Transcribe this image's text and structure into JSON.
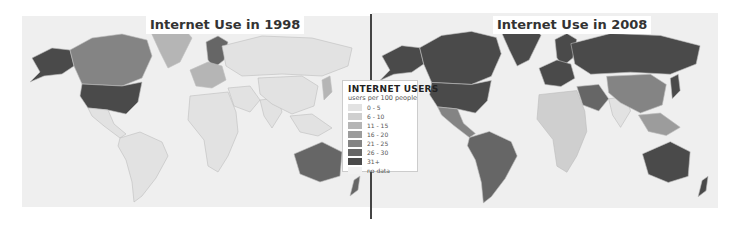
{
  "maps": [
    {
      "title": "Internet Use in 1998",
      "regions": {
        "usa": "31+",
        "alaska": "31+",
        "canada": "21 - 25",
        "greenland": "11 - 15",
        "mexico_central_america": "0 - 5",
        "south_america": "0 - 5",
        "scandinavia": "26 - 30",
        "western_europe": "11 - 15",
        "russia_asia": "0 - 5",
        "africa": "0 - 5",
        "middle_east": "0 - 5",
        "india": "0 - 5",
        "china": "0 - 5",
        "japan": "11 - 15",
        "southeast_asia": "0 - 5",
        "australia": "26 - 30",
        "new_zealand": "26 - 30"
      }
    },
    {
      "title": "Internet Use in 2008",
      "regions": {
        "usa": "31+",
        "alaska": "31+",
        "canada": "31+",
        "greenland": "31+",
        "mexico_central_america": "21 - 25",
        "south_america": "26 - 30",
        "scandinavia": "31+",
        "western_europe": "31+",
        "russia_asia": "31+",
        "africa": "6 - 10",
        "middle_east": "26 - 30",
        "india": "0 - 5",
        "china": "21 - 25",
        "japan": "31+",
        "southeast_asia": "16 - 20",
        "australia": "31+",
        "new_zealand": "31+"
      }
    }
  ],
  "legend": {
    "title": "INTERNET USERS",
    "subtitle": "users per 100 people",
    "items": [
      {
        "label": "0 - 5",
        "color": "#e2e2e2"
      },
      {
        "label": "6 - 10",
        "color": "#cfcfcf"
      },
      {
        "label": "11 - 15",
        "color": "#b5b5b5"
      },
      {
        "label": "16 - 20",
        "color": "#9c9c9c"
      },
      {
        "label": "21 - 25",
        "color": "#848484"
      },
      {
        "label": "26 - 30",
        "color": "#666666"
      },
      {
        "label": "31+",
        "color": "#4a4a4a"
      },
      {
        "label": "no data",
        "color": "#f1f1f1"
      }
    ]
  }
}
